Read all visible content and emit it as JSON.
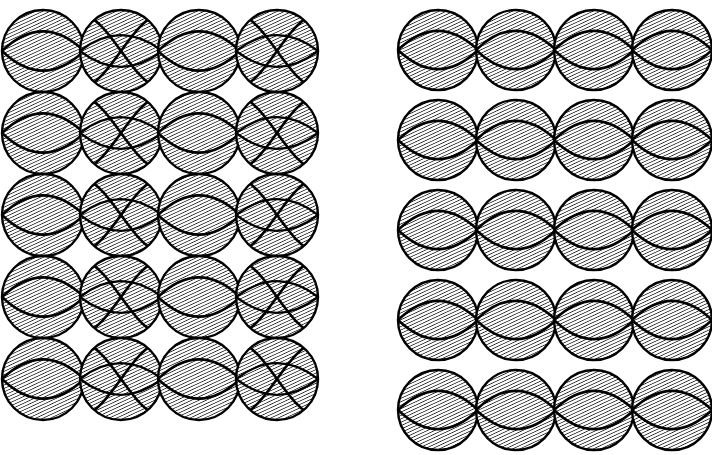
{
  "page": {
    "background_color": "#ffffff",
    "ink_color": "#000000",
    "hatch_color": "#1c1c1c",
    "width": 712,
    "height": 455
  },
  "caption": {
    "text": "",
    "note": "caption text is cropped off the bottom edge of the screenshot"
  },
  "panels": [
    {
      "id": "left-panel",
      "name": "square-packed-lattice",
      "x": 2,
      "y": 10,
      "columns": 4,
      "rows": 5,
      "circle_diameter": 82,
      "column_pitch": 78,
      "row_pitch": 82,
      "row_gap": 0,
      "vertically_touching": true,
      "pattern": "alternating-columns",
      "odd_column_motif": "horizontal-lens",
      "even_column_motif": "diagonal-cross-wave",
      "hatch": {
        "angle_deg": 65,
        "spacing_px": 3.1,
        "line_width": 1.5
      }
    },
    {
      "id": "right-panel",
      "name": "row-separated-lattice",
      "x": 398,
      "y": 10,
      "columns": 4,
      "rows": 5,
      "circle_diameter": 80,
      "column_pitch": 78,
      "row_pitch": 90,
      "row_gap": 10,
      "vertically_touching": false,
      "pattern": "uniform-rows",
      "odd_column_motif": "horizontal-lens",
      "even_column_motif": "horizontal-lens",
      "hatch": {
        "angle_deg": 65,
        "spacing_px": 3.1,
        "line_width": 1.5
      }
    }
  ],
  "legend_items": [],
  "annotations": []
}
